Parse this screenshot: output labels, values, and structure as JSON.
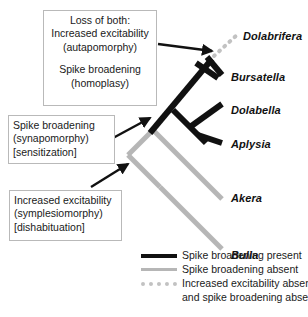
{
  "figure": {
    "type": "phylogenetic-tree",
    "title": "",
    "taxa": [
      {
        "name": "Dolabrifera",
        "x": 243,
        "y": 37,
        "branch_style": "dotted-gray",
        "traits": [
          "increased excitability absent",
          "spike broadening absent"
        ]
      },
      {
        "name": "Bursatella",
        "x": 231,
        "y": 78,
        "branch_style": "solid-black",
        "traits": [
          "spike broadening present"
        ]
      },
      {
        "name": "Dolabella",
        "x": 231,
        "y": 111,
        "branch_style": "solid-black",
        "traits": [
          "spike broadening present"
        ]
      },
      {
        "name": "Aplysia",
        "x": 231,
        "y": 145,
        "branch_style": "solid-black",
        "traits": [
          "spike broadening present"
        ]
      },
      {
        "name": "Akera",
        "x": 231,
        "y": 199,
        "branch_style": "solid-gray",
        "traits": [
          "spike broadening absent"
        ]
      },
      {
        "name": "Bulla",
        "x": 231,
        "y": 256,
        "branch_style": "solid-gray",
        "traits": [
          "spike broadening absent"
        ]
      }
    ]
  },
  "callouts": {
    "loss_of_both": {
      "line1": "Loss of both:",
      "line2": "Increased excitability",
      "line3": "(autapomorphy)",
      "line4": "Spike broadening",
      "line5": "(homoplasy)"
    },
    "synapomorphy": {
      "line1": "Spike broadening",
      "line2": "(synapomorphy)",
      "line3": "[sensitization]"
    },
    "symplesiomorphy": {
      "line1": "Increased excitability",
      "line2": "(symplesiomorphy)",
      "line3": "[dishabituation]"
    }
  },
  "legend": {
    "items": [
      {
        "swatch": "solid-black",
        "line1": "Spike broadening present",
        "line2": ""
      },
      {
        "swatch": "solid-gray",
        "line1": "Spike broadening absent",
        "line2": ""
      },
      {
        "swatch": "dotted-gray",
        "line1": "Increased excitability absent",
        "line2": "and spike broadening absent"
      }
    ]
  },
  "colors": {
    "black_branch": "#111111",
    "gray_branch": "#b6b6b6",
    "dotted_branch": "#c2c2c2",
    "box_border": "#b9b9b9",
    "text": "#1a1a1a",
    "background": "#ffffff"
  }
}
